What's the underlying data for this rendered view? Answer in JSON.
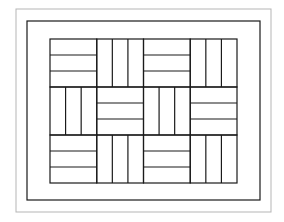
{
  "diagram": {
    "type": "basketweave-quilt-pattern",
    "canvas": {
      "width": 284,
      "height": 222,
      "background": "#ffffff"
    },
    "outer_border": {
      "x": 16,
      "y": 9,
      "width": 255,
      "height": 203,
      "stroke": "#b5b5b5",
      "stroke_width": 1
    },
    "inner_border": {
      "x": 27,
      "y": 21,
      "width": 233,
      "height": 179,
      "stroke": "#1a1a1a",
      "stroke_width": 1.2
    },
    "grid": {
      "x": 50,
      "y": 39,
      "cols": 4,
      "rows": 3,
      "cell_width": 46.75,
      "cell_height": 48,
      "strips_per_block": 3,
      "stroke": "#1a1a1a",
      "stroke_width": 1.2,
      "orientations": [
        [
          "horizontal",
          "vertical",
          "horizontal",
          "vertical"
        ],
        [
          "vertical",
          "horizontal",
          "vertical",
          "horizontal"
        ],
        [
          "horizontal",
          "vertical",
          "horizontal",
          "vertical"
        ]
      ]
    }
  }
}
